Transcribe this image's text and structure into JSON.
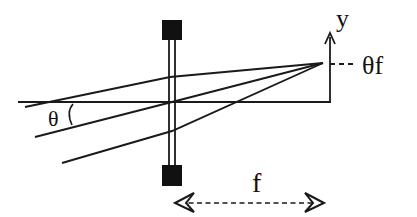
{
  "diagram": {
    "type": "optics-ray-diagram",
    "colors": {
      "stroke": "#1a1a1a",
      "lens_mount": "#111111",
      "background": "#ffffff"
    },
    "labels": {
      "y_axis": "y",
      "image_height": "θf",
      "angle": "θ",
      "focal_length": "f"
    },
    "elements": {
      "optical_axis": {
        "x1": 18,
        "y1": 102,
        "x2": 331,
        "y2": 102
      },
      "lens": {
        "x_left": 169,
        "x_right": 175,
        "y_top": 40,
        "y_bottom": 165
      },
      "lens_mount_top": {
        "x": 162,
        "y": 20,
        "w": 20,
        "h": 20
      },
      "lens_mount_bottom": {
        "x": 162,
        "y": 165,
        "w": 20,
        "h": 21
      },
      "focal_point": {
        "x": 323,
        "y": 63
      },
      "rays": [
        {
          "from": [
            25,
            107
          ],
          "via": [
            170,
            77
          ],
          "to": [
            323,
            63
          ]
        },
        {
          "from": [
            35,
            137
          ],
          "via": [
            172,
            102
          ],
          "to": [
            323,
            63
          ]
        },
        {
          "from": [
            62,
            163
          ],
          "via": [
            172,
            131
          ],
          "to": [
            323,
            63
          ]
        }
      ],
      "y_axis_arrow": {
        "x": 330,
        "y_bottom": 102,
        "y_top": 34
      },
      "focal_length_arrow": {
        "x1": 175,
        "x2": 322,
        "y": 203
      }
    }
  }
}
